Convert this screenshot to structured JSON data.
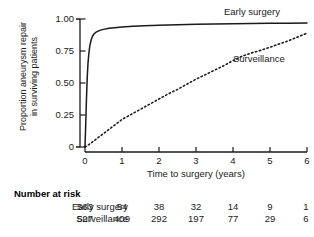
{
  "chart_data": {
    "type": "line",
    "title": "",
    "xlabel": "Time to surgery (years)",
    "ylabel_line1": "Proportion aneurysm repair",
    "ylabel_line2": "in surviving patients",
    "xlim": [
      0,
      6
    ],
    "ylim": [
      0,
      1.0
    ],
    "xticks": [
      0,
      1,
      2,
      3,
      4,
      5,
      6
    ],
    "xticklabels": [
      "0",
      "1",
      "2",
      "3",
      "4",
      "5",
      "6"
    ],
    "yticks": [
      0,
      0.25,
      0.5,
      0.75,
      1.0
    ],
    "yticklabels": [
      "0",
      "0.25",
      "0.50",
      "0.75",
      "1.00"
    ],
    "grid": false,
    "legend_position": "inline-annotations",
    "series": [
      {
        "name": "Early surgery",
        "style": "solid",
        "color": "#1a1a1a",
        "annotation": "Early surgery",
        "x": [
          0,
          0.02,
          0.04,
          0.06,
          0.08,
          0.1,
          0.13,
          0.16,
          0.2,
          0.25,
          0.3,
          0.4,
          0.5,
          0.65,
          0.8,
          1.0,
          1.3,
          1.6,
          2.0,
          2.5,
          3.0,
          3.5,
          4.0,
          4.5,
          5.0,
          5.5,
          6.0
        ],
        "y": [
          0,
          0.18,
          0.38,
          0.54,
          0.65,
          0.72,
          0.79,
          0.83,
          0.865,
          0.885,
          0.897,
          0.911,
          0.919,
          0.927,
          0.932,
          0.938,
          0.944,
          0.948,
          0.952,
          0.956,
          0.959,
          0.961,
          0.963,
          0.965,
          0.966,
          0.967,
          0.968
        ]
      },
      {
        "name": "Surveillance",
        "style": "dotted",
        "color": "#1a1a1a",
        "annotation": "Surveillance",
        "x": [
          0,
          0.1,
          0.25,
          0.5,
          0.75,
          1.0,
          1.25,
          1.5,
          1.75,
          2.0,
          2.25,
          2.5,
          2.75,
          3.0,
          3.25,
          3.5,
          3.75,
          4.0,
          4.25,
          4.5,
          4.75,
          5.0,
          5.25,
          5.5,
          5.75,
          6.0
        ],
        "y": [
          0,
          0.018,
          0.05,
          0.105,
          0.16,
          0.215,
          0.255,
          0.295,
          0.335,
          0.375,
          0.415,
          0.45,
          0.49,
          0.53,
          0.565,
          0.6,
          0.635,
          0.675,
          0.71,
          0.735,
          0.755,
          0.78,
          0.805,
          0.83,
          0.86,
          0.89
        ]
      }
    ]
  },
  "risk_table": {
    "title": "Number at risk",
    "time_points": [
      0,
      1,
      2,
      3,
      4,
      5,
      6
    ],
    "rows": [
      {
        "label": "Early surgery",
        "values": [
          "563",
          "54",
          "38",
          "32",
          "14",
          "9",
          "1"
        ]
      },
      {
        "label": "Surveillance",
        "values": [
          "527",
          "409",
          "292",
          "197",
          "77",
          "29",
          "6"
        ]
      }
    ]
  }
}
